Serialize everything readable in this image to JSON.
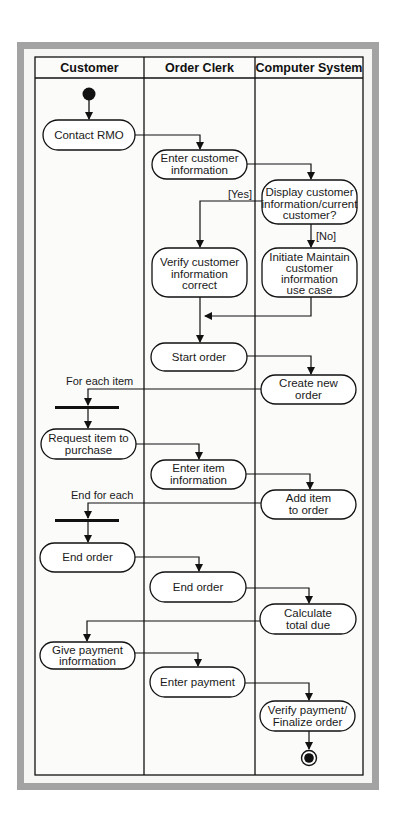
{
  "diagram": {
    "type": "UML activity diagram (swimlanes)",
    "lanes": [
      {
        "id": "customer",
        "label": "Customer"
      },
      {
        "id": "clerk",
        "label": "Order Clerk"
      },
      {
        "id": "system",
        "label": "Computer System"
      }
    ],
    "nodes": [
      {
        "id": "start",
        "kind": "initial",
        "lane": "customer"
      },
      {
        "id": "n1",
        "lane": "customer",
        "lines": [
          "Contact RMO"
        ]
      },
      {
        "id": "n2",
        "lane": "clerk",
        "lines": [
          "Enter customer",
          "information"
        ]
      },
      {
        "id": "n3",
        "lane": "system",
        "lines": [
          "Display customer",
          "information/current",
          "customer?"
        ]
      },
      {
        "id": "n4",
        "lane": "clerk",
        "lines": [
          "Verify customer",
          "information",
          "correct"
        ]
      },
      {
        "id": "n5",
        "lane": "system",
        "lines": [
          "Initiate Maintain",
          "customer",
          "information",
          "use case"
        ]
      },
      {
        "id": "n6",
        "lane": "clerk",
        "lines": [
          "Start order"
        ]
      },
      {
        "id": "n7",
        "lane": "system",
        "lines": [
          "Create new",
          "order"
        ]
      },
      {
        "id": "fork1",
        "kind": "sync-bar",
        "lane": "customer"
      },
      {
        "id": "n8",
        "lane": "customer",
        "lines": [
          "Request item to",
          "purchase"
        ]
      },
      {
        "id": "n9",
        "lane": "clerk",
        "lines": [
          "Enter item",
          "information"
        ]
      },
      {
        "id": "n10",
        "lane": "system",
        "lines": [
          "Add item",
          "to order"
        ]
      },
      {
        "id": "fork2",
        "kind": "sync-bar",
        "lane": "customer"
      },
      {
        "id": "n11",
        "lane": "customer",
        "lines": [
          "End order"
        ]
      },
      {
        "id": "n12",
        "lane": "clerk",
        "lines": [
          "End order"
        ]
      },
      {
        "id": "n13",
        "lane": "system",
        "lines": [
          "Calculate",
          "total due"
        ]
      },
      {
        "id": "n14",
        "lane": "customer",
        "lines": [
          "Give payment",
          "information"
        ]
      },
      {
        "id": "n15",
        "lane": "clerk",
        "lines": [
          "Enter payment"
        ]
      },
      {
        "id": "n16",
        "lane": "system",
        "lines": [
          "Verify payment/",
          "Finalize order"
        ]
      },
      {
        "id": "end",
        "kind": "final",
        "lane": "system"
      }
    ],
    "guards": {
      "yes": "[Yes]",
      "no": "[No]"
    },
    "annotations": {
      "for_each": "For each item",
      "end_for_each": "End for each"
    },
    "edges": [
      [
        "start",
        "n1"
      ],
      [
        "n1",
        "n2"
      ],
      [
        "n2",
        "n3"
      ],
      [
        "n3",
        "n4",
        "[Yes]"
      ],
      [
        "n3",
        "n5",
        "[No]"
      ],
      [
        "n5",
        "merge"
      ],
      [
        "n4",
        "n6"
      ],
      [
        "n6",
        "n7"
      ],
      [
        "n7",
        "fork1",
        "For each item"
      ],
      [
        "fork1",
        "n8"
      ],
      [
        "n8",
        "n9"
      ],
      [
        "n9",
        "n10"
      ],
      [
        "n10",
        "fork2",
        "End for each"
      ],
      [
        "fork2",
        "n11"
      ],
      [
        "n11",
        "n12"
      ],
      [
        "n12",
        "n13"
      ],
      [
        "n13",
        "n14"
      ],
      [
        "n14",
        "n15"
      ],
      [
        "n15",
        "n16"
      ],
      [
        "n16",
        "end"
      ]
    ],
    "colors": {
      "outer_border": "#a3a3a3",
      "inner_background": "#f6f6f4",
      "node_fill": "#ffffff",
      "stroke": "#111111"
    }
  }
}
